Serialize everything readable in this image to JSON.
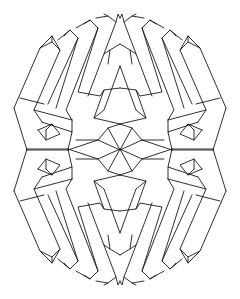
{
  "figure": {
    "title": "Impossible geometric figure line drawing",
    "stroke_color": "#1a1a1a",
    "background": "#ffffff",
    "center": [
      120,
      150
    ],
    "symmetry": [
      "horizontal",
      "vertical"
    ],
    "quadrant_top_left": {
      "polylines": [
        [
          [
            14,
            108
          ],
          [
            40,
            48
          ],
          [
            52,
            42
          ],
          [
            60,
            50
          ],
          [
            34,
            110
          ],
          [
            42,
            122
          ]
        ],
        [
          [
            40,
            48
          ],
          [
            52,
            36
          ],
          [
            60,
            50
          ]
        ],
        [
          [
            52,
            42
          ],
          [
            52,
            36
          ]
        ],
        [
          [
            34,
            110
          ],
          [
            72,
            120
          ]
        ],
        [
          [
            20,
            98
          ],
          [
            44,
            104
          ]
        ],
        [
          [
            58,
            40
          ],
          [
            70,
            30
          ],
          [
            78,
            38
          ],
          [
            48,
            104
          ]
        ],
        [
          [
            64,
            36
          ],
          [
            70,
            30
          ]
        ],
        [
          [
            78,
            38
          ],
          [
            56,
            108
          ]
        ],
        [
          [
            76,
            28
          ],
          [
            90,
            20
          ],
          [
            98,
            28
          ],
          [
            66,
            110
          ],
          [
            72,
            120
          ]
        ],
        [
          [
            84,
            24
          ],
          [
            90,
            20
          ]
        ],
        [
          [
            98,
            28
          ],
          [
            78,
            92
          ],
          [
            100,
            96
          ],
          [
            104,
            90
          ],
          [
            120,
            88
          ]
        ],
        [
          [
            96,
            18
          ],
          [
            108,
            16
          ],
          [
            116,
            22
          ],
          [
            88,
            96
          ]
        ],
        [
          [
            104,
            14
          ],
          [
            108,
            16
          ]
        ],
        [
          [
            116,
            22
          ],
          [
            118,
            14
          ],
          [
            120,
            18
          ]
        ],
        [
          [
            110,
            50
          ],
          [
            120,
            44
          ]
        ],
        [
          [
            104,
            54
          ],
          [
            110,
            50
          ],
          [
            108,
            64
          ]
        ],
        [
          [
            120,
            66
          ],
          [
            104,
            110
          ],
          [
            94,
            118
          ],
          [
            120,
            124
          ]
        ],
        [
          [
            94,
            118
          ],
          [
            104,
            90
          ]
        ],
        [
          [
            14,
            108
          ],
          [
            27,
            150
          ]
        ],
        [
          [
            42,
            122
          ],
          [
            72,
            132
          ],
          [
            68,
            150
          ]
        ],
        [
          [
            72,
            120
          ],
          [
            72,
            132
          ]
        ],
        [
          [
            38,
            130
          ],
          [
            52,
            124
          ],
          [
            60,
            134
          ],
          [
            46,
            140
          ],
          [
            38,
            130
          ]
        ],
        [
          [
            46,
            130
          ],
          [
            52,
            124
          ]
        ],
        [
          [
            46,
            130
          ],
          [
            46,
            140
          ]
        ],
        [
          [
            27,
            150
          ],
          [
            68,
            150
          ]
        ],
        [
          [
            68,
            150
          ],
          [
            98,
            140
          ],
          [
            120,
            150
          ]
        ],
        [
          [
            76,
            140
          ],
          [
            98,
            140
          ]
        ],
        [
          [
            98,
            140
          ],
          [
            108,
            128
          ],
          [
            120,
            124
          ]
        ],
        [
          [
            108,
            128
          ],
          [
            120,
            150
          ]
        ]
      ]
    }
  }
}
